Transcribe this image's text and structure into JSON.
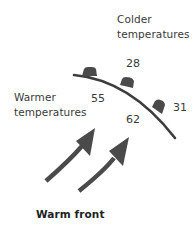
{
  "diagram": {
    "title": "Warm front",
    "regions": {
      "cold": {
        "line1": "Colder",
        "line2": "temperatures"
      },
      "warm": {
        "line1": "Warmer",
        "line2": "temperatures"
      }
    },
    "temperatures": [
      {
        "id": "t28",
        "value": "28",
        "side": "cold"
      },
      {
        "id": "t55",
        "value": "55",
        "side": "warm"
      },
      {
        "id": "t62",
        "value": "62",
        "side": "warm"
      },
      {
        "id": "t31",
        "value": "31",
        "side": "cold"
      }
    ],
    "front": {
      "type": "warm-front",
      "symbol": "semicircles",
      "bump_count": 3,
      "color": "#3d3d3d"
    },
    "arrows": {
      "count": 2,
      "meaning": "warm air movement",
      "color": "#4a4a4a"
    }
  }
}
